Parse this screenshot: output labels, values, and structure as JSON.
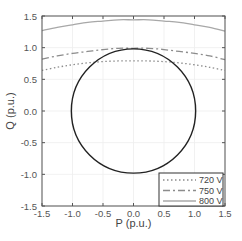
{
  "chart_data": {
    "type": "line",
    "title": "",
    "xlabel": "P (p.u.)",
    "ylabel": "Q (p.u.)",
    "xlim": [
      -1.5,
      1.5
    ],
    "ylim": [
      -1.5,
      1.5
    ],
    "xticks": [
      "-1.5",
      "-1.0",
      "-0.5",
      "0.0",
      "0.5",
      "1.0",
      "1.5"
    ],
    "yticks": [
      "1.5",
      "1.0",
      "0.5",
      "0.0",
      "-0.5",
      "-1.0",
      "-1.5"
    ],
    "grid": true,
    "legend_position": "lower right",
    "x": [
      -1.5,
      -1.25,
      -1.0,
      -0.75,
      -0.5,
      -0.25,
      0.0,
      0.25,
      0.5,
      0.75,
      1.0,
      1.25,
      1.5
    ],
    "series": [
      {
        "name": "720 V",
        "style": "dotted",
        "color": "#8c8c8c",
        "values": [
          0.64,
          0.69,
          0.73,
          0.76,
          0.78,
          0.79,
          0.79,
          0.79,
          0.78,
          0.76,
          0.73,
          0.69,
          0.64
        ]
      },
      {
        "name": "750 V",
        "style": "dashdot",
        "color": "#8c8c8c",
        "values": [
          0.82,
          0.87,
          0.91,
          0.94,
          0.97,
          0.99,
          0.99,
          0.99,
          0.97,
          0.94,
          0.91,
          0.87,
          0.81
        ]
      },
      {
        "name": "800 V",
        "style": "solid",
        "color": "#a8a8a8",
        "values": [
          1.27,
          1.32,
          1.36,
          1.4,
          1.42,
          1.44,
          1.44,
          1.44,
          1.42,
          1.4,
          1.36,
          1.32,
          1.26
        ]
      }
    ],
    "annotations": [
      {
        "type": "circle",
        "center": [
          0,
          0
        ],
        "radius": 1.0,
        "color": "#222222",
        "label": "unit capability circle"
      }
    ]
  },
  "legend": {
    "items": [
      {
        "label": "720 V",
        "dash": "1.5,2.5"
      },
      {
        "label": "750 V",
        "dash": "7,3,2,3"
      },
      {
        "label": "800 V",
        "dash": ""
      }
    ]
  }
}
